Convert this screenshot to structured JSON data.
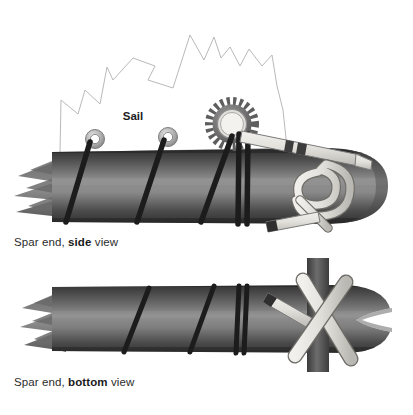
{
  "figure": {
    "background_color": "#ffffff",
    "width": 413,
    "height": 415
  },
  "labels": {
    "sail": "Sail"
  },
  "captions": {
    "side": {
      "prefix": "Spar end, ",
      "emphasis": "side",
      "suffix": " view"
    },
    "bottom": {
      "prefix": "Spar end, ",
      "emphasis": "bottom",
      "suffix": " view"
    }
  },
  "palette": {
    "background": "#ffffff",
    "text": "#2b2b2b",
    "text_bold": "#1a1a1a",
    "spar_dark": "#3a3a3a",
    "spar_mid": "#6e6e6e",
    "spar_light": "#8d8d8d",
    "spar_edge": "#2a2a2a",
    "cord_dark": "#1e1e1e",
    "strap_light": "#e6e4df",
    "strap_shadow": "#b9b7b1",
    "strap_outline": "#5a5a5a",
    "strap_band": "#3d3d3d",
    "sail_outline": "#b5b5b5",
    "grommet_outer": "#9a9a9a",
    "grommet_inner": "#ffffff",
    "gear_body": "#5c5c5c",
    "gear_ring": "#d8d6d1",
    "mast_dark": "#4a4a4a"
  },
  "parts": {
    "sail": "sail-panel",
    "spar_top": "spar-side-view",
    "spar_bottom": "spar-bottom-view",
    "grommets": 2,
    "cord_wraps_side": 5,
    "cord_wraps_bottom": 4,
    "gear": "toothed-ring",
    "strap_loop": "strap-loop-knot",
    "crossed_straps": 2,
    "mast": "vertical-mast"
  }
}
